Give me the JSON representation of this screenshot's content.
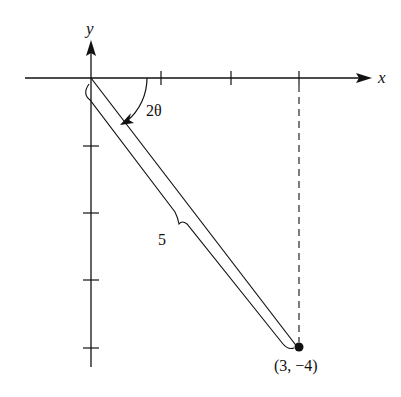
{
  "diagram": {
    "axes": {
      "x_label": "x",
      "y_label": "y"
    },
    "angle_label": "2θ",
    "length_label": "5",
    "point_label": "(3, −4)",
    "point": {
      "x": 3,
      "y": -4
    },
    "x_ticks": [
      1,
      2,
      3
    ],
    "y_ticks": [
      -1,
      -2,
      -3,
      -4
    ],
    "colors": {
      "ink": "#111111",
      "background": "#ffffff"
    }
  }
}
